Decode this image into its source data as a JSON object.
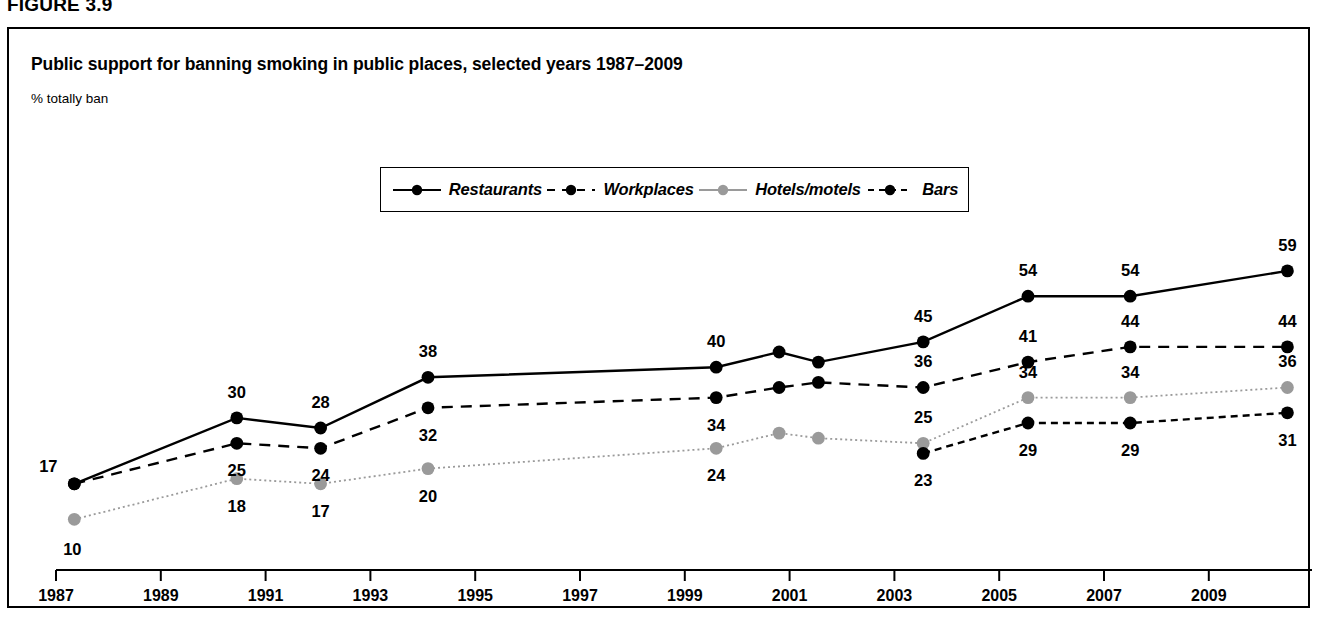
{
  "figure": {
    "label": "FIGURE 3.9"
  },
  "chart_panel": {
    "title": "Public support for banning smoking in public places, selected years 1987–2009",
    "axis_note": "% totally ban"
  },
  "colors": {
    "ink": "#000000",
    "gray_series": "#9a9a9a",
    "border": "#000000",
    "background": "#ffffff"
  },
  "legend": {
    "position": "top-center",
    "entries": [
      {
        "label": "Restaurants",
        "marker": "filled-circle-black",
        "line": "solid",
        "color": "#000000"
      },
      {
        "label": "Workplaces",
        "marker": "filled-circle-black",
        "line": "dashed",
        "color": "#000000"
      },
      {
        "label": "Hotels/motels",
        "marker": "filled-circle-gray",
        "line": "dotted",
        "color": "#9a9a9a"
      },
      {
        "label": "Bars",
        "marker": "filled-circle-black",
        "line": "dash-dot",
        "color": "#000000"
      }
    ]
  },
  "chart_data": {
    "type": "line",
    "title": "Public support for banning smoking in public places, selected years 1987–2009",
    "subtitle": "",
    "xlabel": "",
    "ylabel": "% totally ban",
    "xlim": [
      1986.6,
      1911.0
    ],
    "ylim": [
      0,
      62
    ],
    "grid": false,
    "legend_position": "top-center",
    "x_ticks": [
      1987,
      1989,
      1991,
      1993,
      1995,
      1997,
      1999,
      2001,
      2003,
      2005,
      2007,
      2009
    ],
    "x_tick_labels": [
      "1987",
      "1989",
      "1991",
      "1993",
      "1995",
      "1997",
      "1999",
      "2001",
      "2003",
      "2005",
      "2007",
      "2009"
    ],
    "series": [
      {
        "name": "Restaurants",
        "color": "#000000",
        "line": "solid",
        "points": [
          {
            "x": 1987.35,
            "y": 17,
            "label": "17",
            "label_pos": "left-above"
          },
          {
            "x": 1990.45,
            "y": 30,
            "label": "30",
            "label_pos": "above"
          },
          {
            "x": 1992.05,
            "y": 28,
            "label": "28",
            "label_pos": "above"
          },
          {
            "x": 1994.1,
            "y": 38,
            "label": "38",
            "label_pos": "above"
          },
          {
            "x": 1999.6,
            "y": 40,
            "label": "40",
            "label_pos": "above"
          },
          {
            "x": 2000.8,
            "y": 43,
            "label": "",
            "label_pos": "none"
          },
          {
            "x": 2001.55,
            "y": 41,
            "label": "",
            "label_pos": "none"
          },
          {
            "x": 2003.55,
            "y": 45,
            "label": "45",
            "label_pos": "above"
          },
          {
            "x": 2005.55,
            "y": 54,
            "label": "54",
            "label_pos": "above"
          },
          {
            "x": 2007.5,
            "y": 54,
            "label": "54",
            "label_pos": "above"
          },
          {
            "x": 2010.5,
            "y": 59,
            "label": "59",
            "label_pos": "above"
          }
        ]
      },
      {
        "name": "Workplaces",
        "color": "#000000",
        "line": "dashed",
        "points": [
          {
            "x": 1987.35,
            "y": 17,
            "label": "",
            "label_pos": "none"
          },
          {
            "x": 1990.45,
            "y": 25,
            "label": "25",
            "label_pos": "below"
          },
          {
            "x": 1992.05,
            "y": 24,
            "label": "24",
            "label_pos": "below"
          },
          {
            "x": 1994.1,
            "y": 32,
            "label": "32",
            "label_pos": "below"
          },
          {
            "x": 1999.6,
            "y": 34,
            "label": "34",
            "label_pos": "below"
          },
          {
            "x": 2000.8,
            "y": 36,
            "label": "",
            "label_pos": "none"
          },
          {
            "x": 2001.55,
            "y": 37,
            "label": "",
            "label_pos": "none"
          },
          {
            "x": 2003.55,
            "y": 36,
            "label": "36",
            "label_pos": "above"
          },
          {
            "x": 2005.55,
            "y": 41,
            "label": "41",
            "label_pos": "above"
          },
          {
            "x": 2007.5,
            "y": 44,
            "label": "44",
            "label_pos": "above"
          },
          {
            "x": 2010.5,
            "y": 44,
            "label": "44",
            "label_pos": "above"
          }
        ]
      },
      {
        "name": "Hotels/motels",
        "color": "#9a9a9a",
        "line": "dotted",
        "points": [
          {
            "x": 1987.35,
            "y": 10,
            "label": "10",
            "label_pos": "below-left"
          },
          {
            "x": 1990.45,
            "y": 18,
            "label": "18",
            "label_pos": "below"
          },
          {
            "x": 1992.05,
            "y": 17,
            "label": "17",
            "label_pos": "below"
          },
          {
            "x": 1994.1,
            "y": 20,
            "label": "20",
            "label_pos": "below"
          },
          {
            "x": 1999.6,
            "y": 24,
            "label": "24",
            "label_pos": "below"
          },
          {
            "x": 2000.8,
            "y": 27,
            "label": "",
            "label_pos": "none"
          },
          {
            "x": 2001.55,
            "y": 26,
            "label": "",
            "label_pos": "none"
          },
          {
            "x": 2003.55,
            "y": 25,
            "label": "25",
            "label_pos": "above"
          },
          {
            "x": 2005.55,
            "y": 34,
            "label": "34",
            "label_pos": "above"
          },
          {
            "x": 2007.5,
            "y": 34,
            "label": "34",
            "label_pos": "above"
          },
          {
            "x": 2010.5,
            "y": 36,
            "label": "36",
            "label_pos": "above"
          }
        ]
      },
      {
        "name": "Bars",
        "color": "#000000",
        "line": "dash-dot",
        "points": [
          {
            "x": 2003.55,
            "y": 23,
            "label": "23",
            "label_pos": "below"
          },
          {
            "x": 2005.55,
            "y": 29,
            "label": "29",
            "label_pos": "below"
          },
          {
            "x": 2007.5,
            "y": 29,
            "label": "29",
            "label_pos": "below"
          },
          {
            "x": 2010.5,
            "y": 31,
            "label": "31",
            "label_pos": "below"
          }
        ]
      }
    ]
  }
}
